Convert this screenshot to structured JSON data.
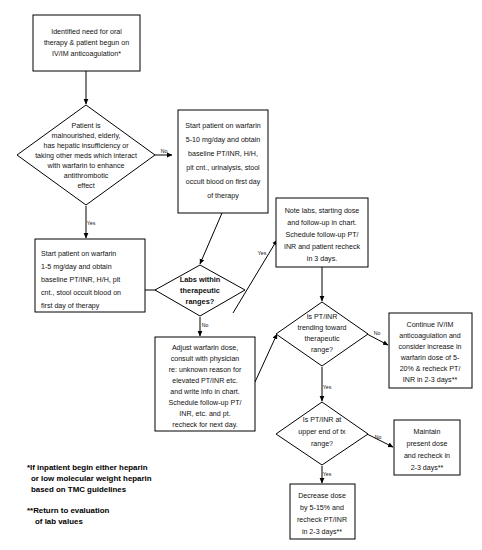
{
  "diagram": {
    "colors": {
      "background": "#ffffff",
      "stroke": "#000000",
      "text": "#111111"
    },
    "nodes": [
      {
        "id": "start",
        "type": "process",
        "name": "identified-need-box",
        "lines": [
          "Identified need for oral",
          "therapy & patient begun on",
          "IV/IM anticoagulation*"
        ]
      },
      {
        "id": "risk-decision",
        "type": "decision",
        "name": "patient-risk-decision",
        "lines": [
          "Patient is",
          "malnourished, elderly,",
          "has hepatic insufficiency or",
          "taking other meds which interact",
          "with warfarin to enhance",
          "antithrombotic",
          "effect"
        ]
      },
      {
        "id": "start-5-10",
        "type": "process",
        "name": "start-warfarin-5-10-box",
        "lines": [
          "Start patient on warfarin",
          "5-10 mg/day and obtain",
          "baseline PT/INR, H/H,",
          "plt cnt., urinalysis, stool",
          "occult blood on first day",
          "of therapy"
        ]
      },
      {
        "id": "start-1-5",
        "type": "process",
        "name": "start-warfarin-1-5-box",
        "lines": [
          "Start patient on warfarin",
          "1-5 mg/day and obtain",
          "baseline PT/INR, H/H, plt",
          "cnt., stool occult blood on",
          "first day of therapy"
        ]
      },
      {
        "id": "labs-decision",
        "type": "decision",
        "name": "labs-within-therapeutic-ranges-decision",
        "bold": true,
        "lines": [
          "Labs within",
          "therapeutic",
          "ranges?"
        ]
      },
      {
        "id": "note-labs",
        "type": "process",
        "name": "note-labs-box",
        "lines": [
          "Note labs, starting dose",
          "and follow-up in chart.",
          "Schedule follow-up PT/",
          "INR and patient recheck",
          "in 3 days."
        ]
      },
      {
        "id": "adjust-dose",
        "type": "process",
        "name": "adjust-warfarin-dose-box",
        "lines": [
          "Adjust warfarin dose,",
          "consult with physician",
          "re: unknown reason for",
          "elevated PT/INR etc.",
          "and write info in chart.",
          "Schedule follow-up PT/",
          "INR, etc. and pt.",
          "recheck for next day."
        ]
      },
      {
        "id": "trending-decision",
        "type": "decision",
        "name": "is-ptinr-trending-decision",
        "lines": [
          "Is PT/INR",
          "trending toward",
          "therapeutic",
          "range?"
        ]
      },
      {
        "id": "continue-ivim",
        "type": "process",
        "name": "continue-ivim-box",
        "lines": [
          "Continue IV/IM",
          "anticoagulation and",
          "consider increase in",
          "warfarin dose of 5-",
          "20% & recheck PT/",
          "INR in 2-3 days**"
        ]
      },
      {
        "id": "upper-end-decision",
        "type": "decision",
        "name": "is-ptinr-upper-end-decision",
        "lines": [
          "Is PT/INR at",
          "upper end of tx",
          "range?"
        ]
      },
      {
        "id": "decrease-dose",
        "type": "process",
        "name": "decrease-dose-box",
        "lines": [
          "Decrease dose",
          "by 5-15% and",
          "recheck PT/INR",
          "in 2-3 days**"
        ]
      },
      {
        "id": "maintain-dose",
        "type": "process",
        "name": "maintain-present-dose-box",
        "lines": [
          "Maintain",
          "present dose",
          "and recheck in",
          "2-3 days**"
        ]
      }
    ],
    "edge_labels": {
      "risk_no": "No",
      "risk_yes": "Yes",
      "labs_yes": "Yes",
      "labs_no": "No",
      "trending_no": "No",
      "trending_yes": "Yes",
      "upper_no": "No",
      "upper_yes": "Yes"
    },
    "footnotes": [
      {
        "name": "footnote-single-asterisk",
        "lines": [
          "*If inpatient begin either heparin",
          "or low molecular weight heparin",
          "based on TMC guidelines"
        ]
      },
      {
        "name": "footnote-double-asterisk",
        "lines": [
          "**Return to evaluation",
          "of lab values"
        ]
      }
    ]
  }
}
